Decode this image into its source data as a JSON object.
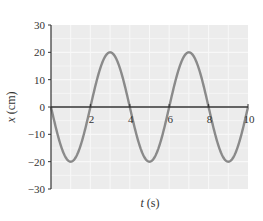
{
  "chart_data": {
    "type": "line",
    "title": "",
    "xlabel": "t (s)",
    "ylabel": "x (cm)",
    "xlim": [
      0,
      10
    ],
    "ylim": [
      -30,
      30
    ],
    "xticks": [
      2,
      4,
      6,
      8,
      10
    ],
    "yticks": [
      30,
      20,
      10,
      0,
      -10,
      -20,
      -30
    ],
    "grid": true,
    "legend": null,
    "function": "x = -20 sin(pi t / 2)",
    "series": [
      {
        "name": "x(t)",
        "x": [
          0,
          0.5,
          1,
          1.5,
          2,
          2.5,
          3,
          3.5,
          4,
          4.5,
          5,
          5.5,
          6,
          6.5,
          7,
          7.5,
          8,
          8.5,
          9,
          9.5,
          10
        ],
        "values": [
          0,
          -14.1,
          -20,
          -14.1,
          0,
          14.1,
          20,
          14.1,
          0,
          -14.1,
          -20,
          -14.1,
          0,
          14.1,
          20,
          14.1,
          0,
          -14.1,
          -20,
          -14.1,
          0
        ]
      }
    ],
    "colors": {
      "background": "#ececec",
      "grid": "#f8f8f8",
      "curve": "#8a8a8a",
      "axis": "#333333"
    }
  },
  "labels": {
    "xlabel_italic": "t",
    "xlabel_unit": " (s)",
    "ylabel_italic": "x",
    "ylabel_unit": " (cm)",
    "yticks": [
      "30",
      "20",
      "10",
      "0",
      "−10",
      "−20",
      "−30"
    ],
    "xticks": [
      "2",
      "4",
      "6",
      "8",
      "10"
    ]
  }
}
